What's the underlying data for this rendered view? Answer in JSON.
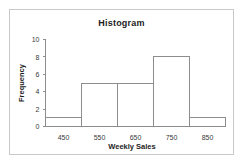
{
  "chart_data": {
    "type": "bar",
    "title": "Histogram",
    "xlabel": "Weekly Sales",
    "ylabel": "Frequency",
    "categories": [
      "450",
      "550",
      "650",
      "750",
      "850"
    ],
    "bin_edges": [
      400,
      500,
      600,
      700,
      800,
      900
    ],
    "values": [
      1,
      5,
      5,
      8,
      1
    ],
    "xtick_labels": [
      "450",
      "550",
      "650",
      "750",
      "850"
    ],
    "xtick_values": [
      450,
      550,
      650,
      750,
      850
    ],
    "ytick_labels": [
      "0",
      "2",
      "4",
      "6",
      "8",
      "10"
    ],
    "ytick_values": [
      0,
      2,
      4,
      6,
      8,
      10
    ],
    "ylim": [
      0,
      10
    ],
    "xlim": [
      400,
      900
    ],
    "grid": false,
    "legend": false,
    "bar_fill": "#ffffff",
    "bar_stroke": "#8d8d8d",
    "axis_color": "#8d8d8d",
    "text_color": "#1d1d1d",
    "frame_color": "#c9c9c9",
    "background": "#ffffff"
  }
}
